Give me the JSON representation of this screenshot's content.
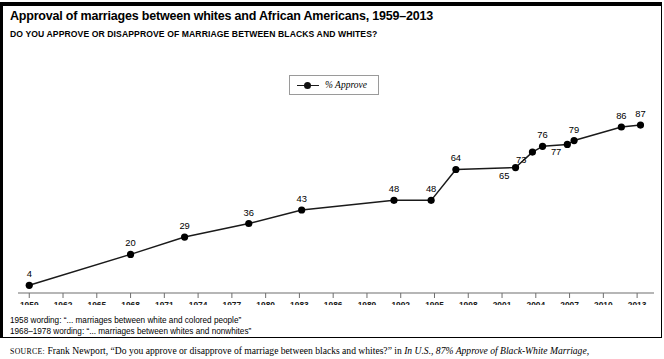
{
  "header": {
    "title": "Approval of marriages between whites and African Americans, 1959–2013",
    "subtitle": "DO YOU APPROVE OR DISAPPROVE OF MARRIAGE BETWEEN BLACKS AND WHITES?"
  },
  "legend": {
    "label": "% Approve"
  },
  "notes": {
    "note1": "1958 wording: “... marriages between white and colored people”",
    "note2": "1968–1978 wording: “... marriages between whites and nonwhites”"
  },
  "source": {
    "prefix": "SOURCE:",
    "text": " Frank Newport, “Do you approve or disapprove of marriage between blacks and whites?” in ",
    "italic_title": "In U.S., 87% Approve of Black-White Marriage,"
  },
  "colors": {
    "line": "#1a1a1a",
    "marker": "#000000",
    "axis": "#6e6e6e",
    "frame": "#000000",
    "background": "#ffffff"
  },
  "chart_data": {
    "type": "line",
    "title": "Approval of marriages between whites and African Americans, 1959–2013",
    "xlabel": "",
    "ylabel": "",
    "xlim": [
      1958,
      2014.5
    ],
    "ylim": [
      0,
      100
    ],
    "grid": false,
    "legend_position": "top-center",
    "x_ticks": [
      1959,
      1962,
      1965,
      1968,
      1971,
      1974,
      1977,
      1980,
      1983,
      1986,
      1989,
      1992,
      1995,
      1998,
      2001,
      2004,
      2007,
      2010,
      2013
    ],
    "y_axis_visible": false,
    "series": [
      {
        "name": "% Approve",
        "points": [
          {
            "x": 1959,
            "y": 4,
            "label": "4",
            "label_pos": "above"
          },
          {
            "x": 1968,
            "y": 20,
            "label": "20",
            "label_pos": "above"
          },
          {
            "x": 1972.8,
            "y": 29,
            "label": "29",
            "label_pos": "above"
          },
          {
            "x": 1978.5,
            "y": 36,
            "label": "36",
            "label_pos": "above"
          },
          {
            "x": 1983.2,
            "y": 43,
            "label": "43",
            "label_pos": "above"
          },
          {
            "x": 1991.4,
            "y": 48,
            "label": "48",
            "label_pos": "above"
          },
          {
            "x": 1994.7,
            "y": 48,
            "label": "48",
            "label_pos": "above"
          },
          {
            "x": 1996.9,
            "y": 64,
            "label": "64",
            "label_pos": "above"
          },
          {
            "x": 2002.2,
            "y": 65,
            "label": "65",
            "label_pos": "below-left"
          },
          {
            "x": 2003.7,
            "y": 73,
            "label": "73",
            "label_pos": "below-left"
          },
          {
            "x": 2004.6,
            "y": 76,
            "label": "76",
            "label_pos": "above"
          },
          {
            "x": 2006.8,
            "y": 77,
            "label": "77",
            "label_pos": "below-left"
          },
          {
            "x": 2007.4,
            "y": 79,
            "label": "79",
            "label_pos": "above"
          },
          {
            "x": 2011.6,
            "y": 86,
            "label": "86",
            "label_pos": "above"
          },
          {
            "x": 2013.3,
            "y": 87,
            "label": "87",
            "label_pos": "above"
          }
        ]
      }
    ]
  }
}
